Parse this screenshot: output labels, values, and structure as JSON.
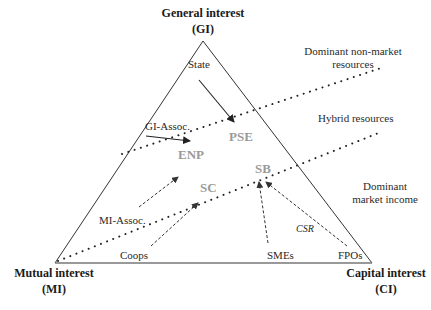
{
  "diagram": {
    "vertices": {
      "top": {
        "label": "General interest",
        "abbr": "(GI)"
      },
      "left": {
        "label": "Mutual interest",
        "abbr": "(MI)"
      },
      "right": {
        "label": "Capital interest",
        "abbr": "(CI)"
      }
    },
    "zones": {
      "upper": {
        "line1": "Dominant non-market",
        "line2": "resources"
      },
      "middle": {
        "label": "Hybrid resources"
      },
      "lower": {
        "line1": "Dominant",
        "line2": "market income"
      }
    },
    "actors": {
      "state": "State",
      "gi_assoc": "GI-Assoc.",
      "mi_assoc": "MI-Assoc.",
      "coops": "Coops",
      "smes": "SMEs",
      "fpos": "FPOs"
    },
    "enterprise_types": {
      "pse": "PSE",
      "enp": "ENP",
      "sc": "SC",
      "sb": "SB"
    },
    "annotations": {
      "csr": "CSR"
    },
    "colors": {
      "line": "#333333",
      "enterprise_label": "#9a9a9a"
    }
  }
}
